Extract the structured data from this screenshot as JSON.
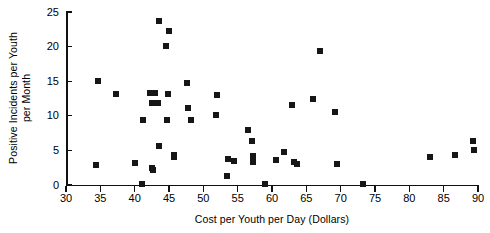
{
  "chart_data": {
    "type": "scatter",
    "title": "",
    "xlabel": "Cost per Youth per Day (Dollars)",
    "ylabel_line1": "Positive Incidents per Youth",
    "ylabel_line2": "per Month",
    "xlim": [
      30,
      90
    ],
    "ylim": [
      0,
      25
    ],
    "xticks": [
      30,
      35,
      40,
      45,
      50,
      55,
      60,
      65,
      70,
      75,
      80,
      85,
      90
    ],
    "yticks": [
      0,
      5,
      10,
      15,
      20,
      25
    ],
    "grid": false,
    "legend": "none",
    "marker": "filled-square",
    "marker_color": "#161616",
    "axis_color": "#111111",
    "points": [
      {
        "x": 34.6,
        "y": 15.0
      },
      {
        "x": 34.3,
        "y": 2.9
      },
      {
        "x": 37.3,
        "y": 13.2
      },
      {
        "x": 40.1,
        "y": 3.2
      },
      {
        "x": 41.0,
        "y": 0.1
      },
      {
        "x": 41.2,
        "y": 9.4
      },
      {
        "x": 42.3,
        "y": 13.3
      },
      {
        "x": 43.0,
        "y": 13.3
      },
      {
        "x": 42.5,
        "y": 11.9
      },
      {
        "x": 43.4,
        "y": 11.9
      },
      {
        "x": 42.5,
        "y": 2.4
      },
      {
        "x": 42.6,
        "y": 2.1
      },
      {
        "x": 43.5,
        "y": 23.7
      },
      {
        "x": 43.6,
        "y": 5.7
      },
      {
        "x": 44.5,
        "y": 20.1
      },
      {
        "x": 45.0,
        "y": 22.2
      },
      {
        "x": 44.8,
        "y": 13.2
      },
      {
        "x": 44.7,
        "y": 9.4
      },
      {
        "x": 45.7,
        "y": 4.3
      },
      {
        "x": 45.8,
        "y": 4.1
      },
      {
        "x": 47.6,
        "y": 14.7
      },
      {
        "x": 47.7,
        "y": 11.1
      },
      {
        "x": 48.2,
        "y": 9.4
      },
      {
        "x": 51.9,
        "y": 10.1
      },
      {
        "x": 52.0,
        "y": 13.0
      },
      {
        "x": 53.6,
        "y": 3.8
      },
      {
        "x": 53.5,
        "y": 1.3
      },
      {
        "x": 54.5,
        "y": 3.5
      },
      {
        "x": 56.5,
        "y": 7.9
      },
      {
        "x": 57.1,
        "y": 6.4
      },
      {
        "x": 57.3,
        "y": 4.2
      },
      {
        "x": 57.2,
        "y": 3.3
      },
      {
        "x": 59.0,
        "y": 0.1
      },
      {
        "x": 60.6,
        "y": 3.6
      },
      {
        "x": 61.7,
        "y": 4.8
      },
      {
        "x": 62.9,
        "y": 11.6
      },
      {
        "x": 63.2,
        "y": 3.3
      },
      {
        "x": 63.6,
        "y": 3.0
      },
      {
        "x": 66.0,
        "y": 12.4
      },
      {
        "x": 67.0,
        "y": 19.4
      },
      {
        "x": 69.2,
        "y": 10.6
      },
      {
        "x": 69.4,
        "y": 3.1
      },
      {
        "x": 73.2,
        "y": 0.1
      },
      {
        "x": 83.0,
        "y": 4.1
      },
      {
        "x": 86.7,
        "y": 4.3
      },
      {
        "x": 89.3,
        "y": 6.3
      },
      {
        "x": 89.4,
        "y": 5.0
      }
    ]
  }
}
